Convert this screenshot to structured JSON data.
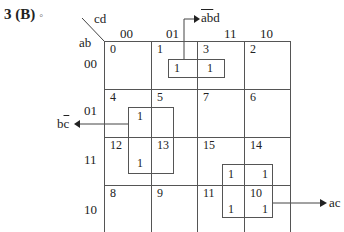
{
  "title": {
    "number": "3",
    "answer": "(B)",
    "mark": "◦"
  },
  "kmap": {
    "col_var": "cd",
    "row_var": "ab",
    "col_headers": [
      "00",
      "01",
      "11",
      "10"
    ],
    "row_headers": [
      "00",
      "01",
      "11",
      "10"
    ],
    "cells": [
      [
        {
          "index": "0",
          "value": ""
        },
        {
          "index": "1",
          "value": "1"
        },
        {
          "index": "3",
          "value": "1"
        },
        {
          "index": "2",
          "value": ""
        }
      ],
      [
        {
          "index": "4",
          "value": ""
        },
        {
          "index": "5",
          "value": "1"
        },
        {
          "index": "7",
          "value": ""
        },
        {
          "index": "6",
          "value": ""
        }
      ],
      [
        {
          "index": "12",
          "value": ""
        },
        {
          "index": "13",
          "value": "1"
        },
        {
          "index": "15",
          "value": "1"
        },
        {
          "index": "14",
          "value": "1"
        }
      ],
      [
        {
          "index": "8",
          "value": ""
        },
        {
          "index": "9",
          "value": ""
        },
        {
          "index": "11",
          "value": "1"
        },
        {
          "index": "10",
          "value": "1"
        }
      ]
    ],
    "groups": [
      {
        "term_label": "abd",
        "term_overlined": "ab",
        "term_plain": "d",
        "cells": [
          "1",
          "3"
        ],
        "arrow": "up"
      },
      {
        "term_label": "bc",
        "term_plain": "b",
        "term_overlined": "c",
        "cells": [
          "5",
          "13"
        ],
        "arrow": "left"
      },
      {
        "term_label": "ac",
        "cells": [
          "15",
          "14",
          "11",
          "10"
        ],
        "arrow": "right"
      }
    ]
  }
}
